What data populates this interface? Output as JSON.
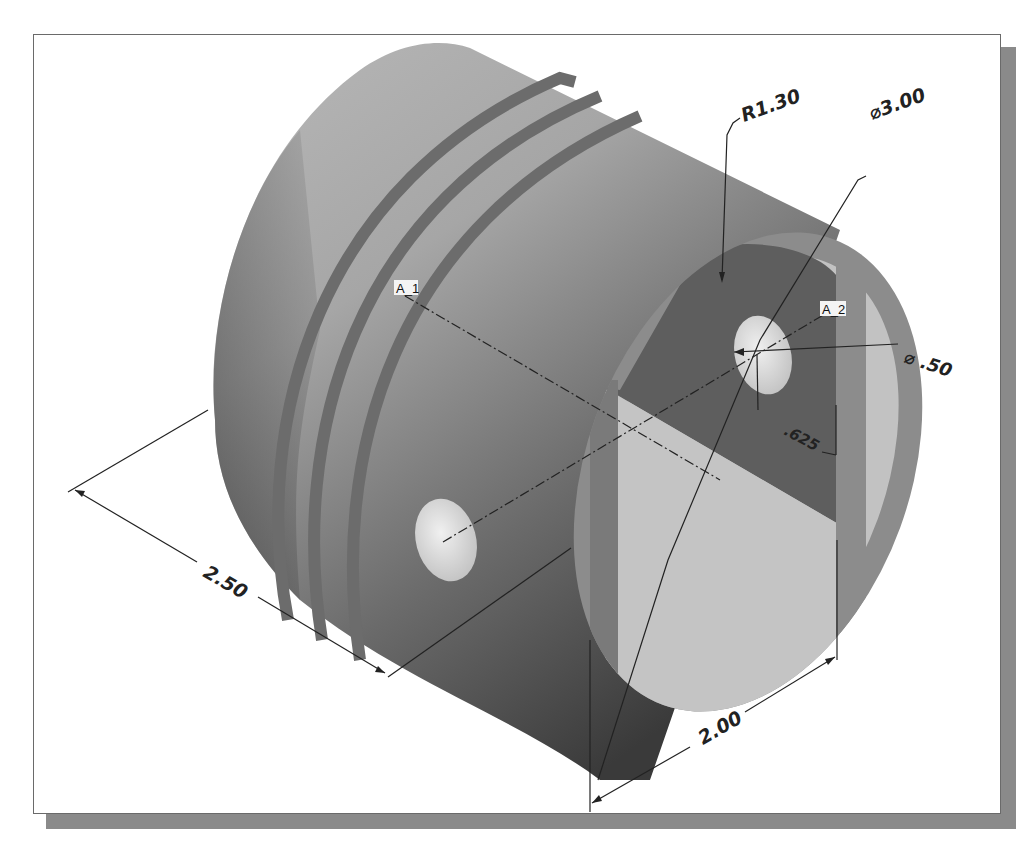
{
  "figure": {
    "colors": {
      "frame_border": "#6a6a6a",
      "shadow": "#8a8a8a",
      "body_light": "#b4b4b4",
      "body_dark": "#3c3c3c",
      "groove": "#6e6e6e",
      "face_rim": "#8c8c8c",
      "inner_dark": "#5e5e5e",
      "inner_light": "#c2c2c2",
      "hole": "#e6e6e6",
      "dimension_line": "#222222"
    }
  },
  "axis_tags": [
    {
      "id": "A1",
      "label": "A_1"
    },
    {
      "id": "A2",
      "label": "A_2"
    }
  ],
  "dimensions": {
    "radius": {
      "label": "R1.30",
      "value": 1.3,
      "kind": "radius"
    },
    "outer_diameter": {
      "label": "⌀3.00",
      "value": 3.0,
      "kind": "diameter"
    },
    "pin_diameter": {
      "label": "⌀ .50",
      "value": 0.5,
      "kind": "diameter"
    },
    "pin_offset": {
      "label": ".625",
      "value": 0.625,
      "kind": "linear"
    },
    "length": {
      "label": "2.50",
      "value": 2.5,
      "kind": "linear"
    },
    "cut_width": {
      "label": "2.00",
      "value": 2.0,
      "kind": "linear"
    }
  },
  "features": {
    "ring_grooves": 3,
    "pin_holes": 2
  }
}
